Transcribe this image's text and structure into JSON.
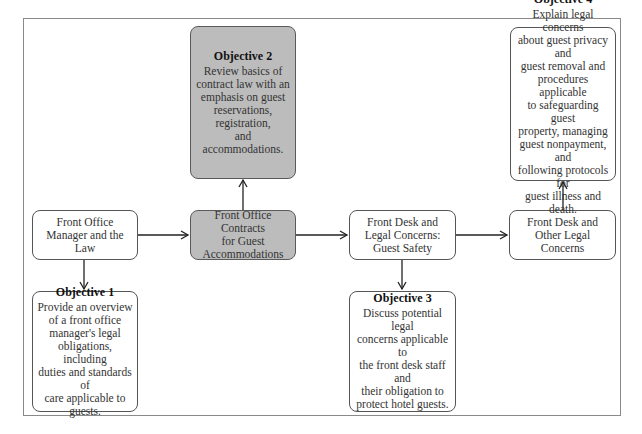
{
  "diagram": {
    "flow": [
      {
        "id": "manager-law",
        "label": "Front Office\nManager and the Law",
        "shaded": false
      },
      {
        "id": "contracts",
        "label": "Front Office Contracts\nfor Guest\nAccommodations",
        "shaded": true
      },
      {
        "id": "guest-safety",
        "label": "Front Desk and\nLegal Concerns:\nGuest Safety",
        "shaded": false
      },
      {
        "id": "other-legal",
        "label": "Front Desk and\nOther Legal Concerns",
        "shaded": false
      }
    ],
    "objectives": [
      {
        "id": "objective-1",
        "title": "Objective 1",
        "text": "Provide an overview\nof a front office\nmanager's legal\nobligations, including\nduties and standards of\ncare applicable to\nguests.",
        "attached_to": "manager-law",
        "position": "below",
        "shaded": false
      },
      {
        "id": "objective-2",
        "title": "Objective 2",
        "text": "Review basics of\ncontract law with an\nemphasis on guest\nreservations,\nregistration,\nand accommodations.",
        "attached_to": "contracts",
        "position": "above",
        "shaded": true
      },
      {
        "id": "objective-3",
        "title": "Objective 3",
        "text": "Discuss potential legal\nconcerns applicable to\nthe front desk staff and\ntheir obligation to\nprotect hotel guests.",
        "attached_to": "guest-safety",
        "position": "below",
        "shaded": false
      },
      {
        "id": "objective-4",
        "title": "Objective 4",
        "text": "Explain legal concerns\nabout guest privacy and\nguest removal and\nprocedures applicable\nto safeguarding guest\nproperty, managing\nguest nonpayment, and\nfollowing protocols for\nguest illness and death.",
        "attached_to": "other-legal",
        "position": "above",
        "shaded": false
      }
    ],
    "edges": [
      {
        "from": "manager-law",
        "to": "contracts"
      },
      {
        "from": "contracts",
        "to": "guest-safety"
      },
      {
        "from": "guest-safety",
        "to": "other-legal"
      },
      {
        "from": "manager-law",
        "to": "objective-1"
      },
      {
        "from": "contracts",
        "to": "objective-2"
      },
      {
        "from": "guest-safety",
        "to": "objective-3"
      },
      {
        "from": "other-legal",
        "to": "objective-4"
      }
    ],
    "colors": {
      "shaded_fill": "#bcbcbc",
      "border": "#555555",
      "frame": "#8a8a8a"
    }
  }
}
